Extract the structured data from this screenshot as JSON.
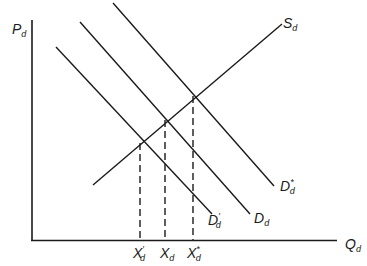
{
  "diagram": {
    "type": "supply-demand",
    "axes": {
      "y_label": "P",
      "y_label_sub": "d",
      "x_label": "Q",
      "x_label_sub": "d"
    },
    "curves": [
      {
        "id": "supply",
        "label": "S",
        "sub": "d",
        "prime": ""
      },
      {
        "id": "demand-low",
        "label": "D",
        "sub": "d",
        "prime": "′"
      },
      {
        "id": "demand",
        "label": "D",
        "sub": "d",
        "prime": ""
      },
      {
        "id": "demand-high",
        "label": "D",
        "sub": "d",
        "prime": "*"
      }
    ],
    "x_ticks": [
      {
        "label": "X",
        "sub": "d",
        "prime": "′"
      },
      {
        "label": "X",
        "sub": "d",
        "prime": ""
      },
      {
        "label": "X",
        "sub": "d",
        "prime": "*"
      }
    ],
    "equilibria": [
      {
        "curve": "demand-low",
        "quantity_tick": 0
      },
      {
        "curve": "demand",
        "quantity_tick": 1
      },
      {
        "curve": "demand-high",
        "quantity_tick": 2
      }
    ]
  }
}
